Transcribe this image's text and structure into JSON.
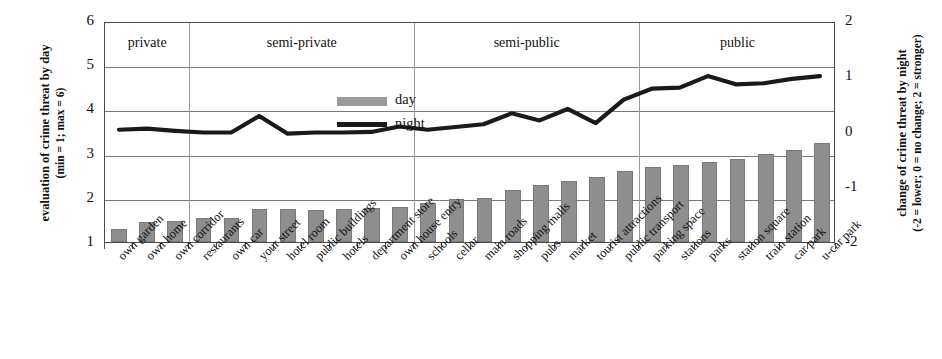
{
  "chart_data": {
    "type": "bar",
    "title": "",
    "ylabel": "evaluation of crime threat by day (min = 1; max = 6)",
    "ylabel_line1": "evaluation of crime threat by day",
    "ylabel_line2": "(min = 1; max = 6)",
    "y2label_line1": "change of crime threat by night",
    "y2label_line2": "(-2 = lower; 0 = no change; 2 = stronger)",
    "xlabel": "",
    "ylim": [
      1,
      6
    ],
    "y2lim": [
      -2,
      2
    ],
    "yticks": [
      "1",
      "2",
      "3",
      "4",
      "5",
      "6"
    ],
    "y2ticks": [
      "-2",
      "-1",
      "0",
      "1",
      "2"
    ],
    "grid": true,
    "legend_position": "inside-top-left",
    "categories": [
      "own garden",
      "own home",
      "own corridor",
      "restaurants",
      "own car",
      "your street",
      "hotel room",
      "public buildings",
      "hotels",
      "department store",
      "own house entry",
      "schools",
      "cellar",
      "main roads",
      "shopping malls",
      "pubs",
      "market",
      "tourist attractions",
      "public transport",
      "parking space",
      "stations",
      "parks",
      "station square",
      "train station",
      "car park",
      "u-car park"
    ],
    "series": [
      {
        "name": "day",
        "type": "bar",
        "axis": "left",
        "color": "#8e8e8e",
        "values": [
          1.3,
          1.45,
          1.48,
          1.55,
          1.55,
          1.75,
          1.75,
          1.72,
          1.75,
          1.78,
          1.8,
          1.88,
          1.97,
          2.0,
          2.18,
          2.28,
          2.38,
          2.47,
          2.6,
          2.7,
          2.75,
          2.8,
          2.88,
          3.0,
          3.08,
          3.25
        ]
      },
      {
        "name": "night",
        "type": "line",
        "axis": "right",
        "color": "#1a1a1a",
        "values": [
          0.05,
          0.07,
          0.03,
          0.0,
          0.0,
          0.3,
          -0.02,
          0.0,
          0.0,
          0.01,
          0.11,
          0.05,
          0.1,
          0.15,
          0.35,
          0.22,
          0.43,
          0.17,
          0.6,
          0.8,
          0.82,
          1.03,
          0.88,
          0.9,
          0.98,
          1.03
        ]
      }
    ],
    "groups": [
      {
        "label": "private",
        "start": 0,
        "end": 2
      },
      {
        "label": "semi-private",
        "start": 3,
        "end": 10
      },
      {
        "label": "semi-public",
        "start": 11,
        "end": 18
      },
      {
        "label": "public",
        "start": 19,
        "end": 25
      }
    ],
    "legend": [
      {
        "label": "day",
        "marker": "bar-swatch"
      },
      {
        "label": "night",
        "marker": "line-swatch"
      }
    ]
  }
}
